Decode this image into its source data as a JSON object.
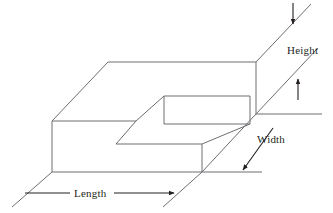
{
  "figure": {
    "shape_name": "stepped-rectangular-block",
    "stroke_color": "#6d6e71",
    "arrow_color": "#231f20",
    "background_color": "#ffffff"
  },
  "labels": {
    "height": "Height",
    "width": "Width",
    "length": "Length"
  },
  "dimensions": [
    {
      "name": "Height",
      "label": "Height",
      "orientation": "vertical",
      "arrows": "double-opposed"
    },
    {
      "name": "Width",
      "label": "Width",
      "orientation": "diagonal",
      "arrows": "single-down-left"
    },
    {
      "name": "Length",
      "label": "Length",
      "orientation": "horizontal",
      "arrows": "single-right"
    }
  ],
  "geometry": {
    "top_back_left": [
      108,
      62
    ],
    "top_back_right": [
      256,
      62
    ],
    "top_front_left": [
      52,
      121
    ],
    "notch_top_left": [
      136,
      96
    ],
    "notch_top_right": [
      222,
      96
    ],
    "notch_inner_left": [
      136,
      124
    ],
    "notch_inner_right": [
      222,
      124
    ],
    "step_front_left": [
      116,
      144
    ],
    "step_front_right": [
      202,
      144
    ],
    "right_lower": [
      256,
      114
    ],
    "bottom_left": [
      52,
      172
    ],
    "bottom_right": [
      202,
      172
    ]
  }
}
